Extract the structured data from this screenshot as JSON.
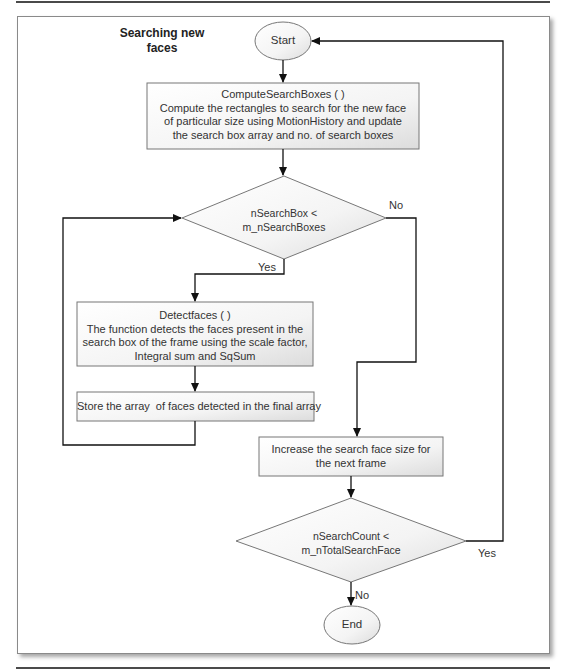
{
  "diagram": {
    "title": "Searching new faces",
    "title_lines": [
      "Searching new",
      "faces"
    ],
    "nodes": {
      "start": {
        "type": "terminal",
        "label": "Start"
      },
      "compute": {
        "type": "process",
        "lines": [
          "ComputeSearchBoxes ( )",
          "Compute the rectangles to search for the new face",
          "of particular size using MotionHistory and update",
          "the search box array and no. of search boxes"
        ]
      },
      "decision1": {
        "type": "decision",
        "lines": [
          "nSearchBox <",
          "m_nSearchBoxes"
        ]
      },
      "detect": {
        "type": "process",
        "lines": [
          "Detectfaces ( )",
          "The function detects the faces present in the",
          "search box of the frame using the scale factor,",
          "Integral sum and SqSum"
        ]
      },
      "store": {
        "type": "process",
        "lines": [
          "Store the array  of faces detected in the final array"
        ]
      },
      "increase": {
        "type": "process",
        "lines": [
          "Increase the search face size for",
          "the next frame"
        ]
      },
      "decision2": {
        "type": "decision",
        "lines": [
          "nSearchCount <",
          "m_nTotalSearchFace"
        ]
      },
      "end": {
        "type": "terminal",
        "label": "End"
      }
    },
    "edges": [
      {
        "from": "start",
        "to": "compute",
        "label": ""
      },
      {
        "from": "compute",
        "to": "decision1",
        "label": ""
      },
      {
        "from": "decision1",
        "to": "detect",
        "label": "Yes"
      },
      {
        "from": "decision1",
        "to": "increase",
        "label": "No"
      },
      {
        "from": "detect",
        "to": "store",
        "label": ""
      },
      {
        "from": "store",
        "to": "decision1",
        "label": ""
      },
      {
        "from": "increase",
        "to": "decision2",
        "label": ""
      },
      {
        "from": "decision2",
        "to": "start",
        "label": "Yes"
      },
      {
        "from": "decision2",
        "to": "end",
        "label": "No"
      }
    ],
    "edge_labels": {
      "d1_yes": "Yes",
      "d1_no": "No",
      "d2_yes": "Yes",
      "d2_no": "No"
    },
    "colors": {
      "line": "#1a1a1a",
      "shape_border": "#7a7a7a",
      "shape_fill_light": "#ffffff",
      "shape_fill_dark": "#e2e2e2"
    }
  }
}
